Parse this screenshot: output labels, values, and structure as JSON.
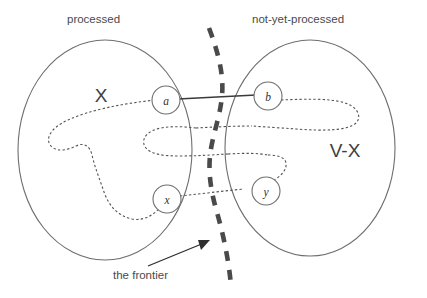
{
  "figure": {
    "headers": {
      "left": "processed",
      "right": "not-yet-processed"
    },
    "sets": [
      {
        "id": "X",
        "label": "X",
        "meaning": "processed"
      },
      {
        "id": "V-X",
        "label": "V-X",
        "meaning": "not-yet-processed"
      }
    ],
    "nodes": [
      {
        "id": "a",
        "label": "a",
        "set": "X"
      },
      {
        "id": "b",
        "label": "b",
        "set": "V-X"
      },
      {
        "id": "x",
        "label": "x",
        "set": "X"
      },
      {
        "id": "y",
        "label": "y",
        "set": "V-X"
      }
    ],
    "edges": [
      {
        "from": "a",
        "to": "b",
        "style": "solid",
        "crosses_frontier": true
      }
    ],
    "frontier": {
      "label": "the frontier",
      "style": "dashed",
      "orientation": "vertical"
    },
    "colors": {
      "outline": "#6e6e6e",
      "dotted_path": "#555555",
      "solid_edge": "#3a3a3a",
      "frontier": "#4a4a4a",
      "text": "#4a4a4a",
      "background": "#ffffff"
    }
  }
}
